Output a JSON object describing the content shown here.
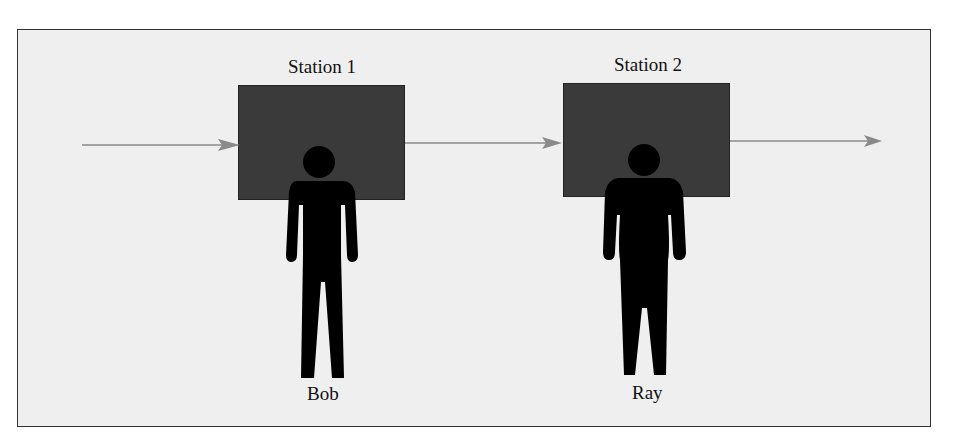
{
  "diagram": {
    "type": "serial production line",
    "stations": [
      {
        "label": "Station 1",
        "worker": "Bob"
      },
      {
        "label": "Station 2",
        "worker": "Ray"
      }
    ],
    "flow_direction": "left-to-right",
    "colors": {
      "background": "#efefef",
      "station_fill": "#3a3a3a",
      "arrow": "#8a8a8a",
      "figure": "#000000"
    }
  }
}
